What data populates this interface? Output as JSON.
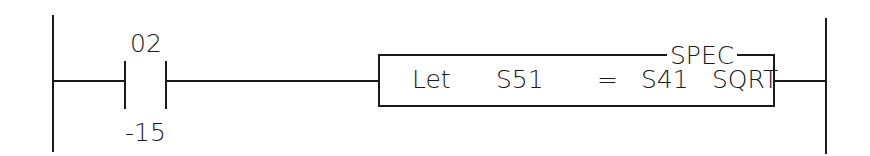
{
  "diagram": {
    "type": "ladder-logic-rung",
    "contact": {
      "address_top": "02",
      "address_bottom": "-15",
      "kind": "normally-open"
    },
    "instruction_box": {
      "category": "SPEC",
      "keyword": "Let",
      "destination": "S51",
      "operator": "=",
      "source": "S41",
      "function": "SQRT"
    },
    "colors": {
      "line": "#1a1a1a",
      "background": "#ffffff"
    }
  }
}
